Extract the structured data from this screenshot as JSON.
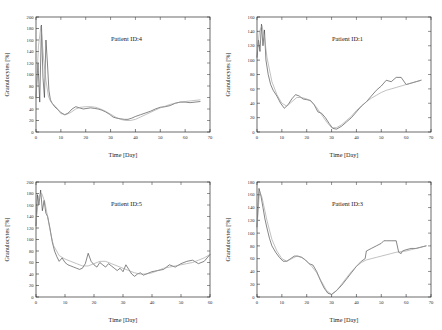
{
  "figure": {
    "layout": "2x2 grid of line plots",
    "panel_order": [
      "p4",
      "p1",
      "p5",
      "p3"
    ]
  },
  "chart_data": [
    {
      "id": "p4",
      "type": "line",
      "title": "Patient ID:4",
      "xlabel": "Time [Day]",
      "ylabel": "Granulocytes [%]",
      "xlim": [
        0,
        70
      ],
      "ylim": [
        0,
        200
      ],
      "xticks": [
        0,
        10,
        20,
        30,
        40,
        50,
        60,
        70
      ],
      "yticks": [
        0,
        20,
        40,
        60,
        80,
        100,
        120,
        140,
        160,
        180,
        200
      ],
      "grid": false,
      "legend": "none",
      "series": [
        {
          "name": "measured",
          "style": "solid-dark",
          "x": [
            0,
            0.8,
            1.5,
            2.2,
            2.8,
            3.4,
            4.0,
            4.6,
            5.2,
            5.8,
            6.5,
            7.5,
            8.5,
            10,
            11.5,
            13,
            14.5,
            16,
            17.5,
            19,
            20.5,
            22,
            23.5,
            25,
            26.5,
            28,
            29.5,
            31,
            32.5,
            34,
            35.5,
            37,
            38.5,
            40,
            42,
            44,
            46,
            48,
            50,
            52,
            54,
            56,
            58,
            60,
            62,
            64,
            66
          ],
          "y": [
            60,
            120,
            52,
            186,
            95,
            60,
            160,
            120,
            72,
            56,
            50,
            44,
            40,
            34,
            30,
            33,
            40,
            44,
            42,
            40,
            41,
            42,
            41,
            40,
            38,
            35,
            31,
            26,
            24,
            23,
            22,
            22,
            24,
            27,
            30,
            33,
            36,
            40,
            43,
            44,
            46,
            50,
            52,
            52,
            51,
            52,
            53
          ]
        },
        {
          "name": "model-fit",
          "style": "solid-light",
          "x": [
            0,
            1,
            2,
            3,
            4,
            5,
            6,
            8,
            10,
            12,
            14,
            16,
            18,
            20,
            22,
            24,
            26,
            28,
            30,
            32,
            34,
            36,
            38,
            40,
            42,
            44,
            46,
            48,
            50,
            52,
            54,
            56,
            58,
            60,
            62,
            64,
            66
          ],
          "y": [
            58,
            150,
            185,
            130,
            90,
            62,
            52,
            44,
            32,
            30,
            34,
            40,
            43,
            44,
            44,
            43,
            40,
            36,
            31,
            26,
            22,
            20,
            20,
            22,
            26,
            30,
            34,
            38,
            42,
            45,
            48,
            50,
            52,
            53,
            54,
            55,
            56
          ]
        }
      ]
    },
    {
      "id": "p1",
      "type": "line",
      "title": "Patient ID:1",
      "xlabel": "Time [Day]",
      "ylabel": "Granulocytes [%]",
      "xlim": [
        0,
        70
      ],
      "ylim": [
        0,
        160
      ],
      "xticks": [
        0,
        10,
        20,
        30,
        40,
        50,
        60,
        70
      ],
      "yticks": [
        0,
        20,
        40,
        60,
        80,
        100,
        120,
        140,
        160
      ],
      "grid": false,
      "legend": "none",
      "series": [
        {
          "name": "measured",
          "style": "solid-dark",
          "x": [
            0,
            0.6,
            1.2,
            1.8,
            2.4,
            3.0,
            3.6,
            4.5,
            5.5,
            6.5,
            8,
            9.5,
            11,
            12.5,
            14,
            15.5,
            17,
            18.5,
            20,
            21.5,
            23,
            24.5,
            26,
            27.5,
            29,
            30.5,
            32,
            34,
            36,
            38,
            40,
            42,
            44,
            46,
            48,
            50,
            52,
            54,
            56,
            58,
            60,
            62,
            64,
            66
          ],
          "y": [
            104,
            128,
            112,
            150,
            120,
            142,
            100,
            80,
            66,
            58,
            50,
            40,
            33,
            38,
            46,
            52,
            50,
            46,
            45,
            44,
            38,
            28,
            26,
            20,
            12,
            5,
            4,
            8,
            14,
            20,
            28,
            36,
            42,
            50,
            58,
            64,
            72,
            70,
            76,
            76,
            66,
            68,
            70,
            72
          ]
        },
        {
          "name": "model-fit",
          "style": "solid-light",
          "x": [
            0,
            1,
            2,
            3,
            4,
            6,
            8,
            10,
            12,
            14,
            16,
            18,
            20,
            22,
            24,
            26,
            28,
            30,
            32,
            34,
            36,
            38,
            40,
            42,
            44,
            46,
            48,
            50,
            52,
            54,
            56,
            58,
            60,
            62,
            64,
            66
          ],
          "y": [
            110,
            140,
            148,
            132,
            104,
            70,
            52,
            40,
            36,
            42,
            48,
            48,
            46,
            42,
            34,
            24,
            14,
            6,
            6,
            10,
            16,
            22,
            30,
            36,
            42,
            47,
            51,
            55,
            58,
            60,
            62,
            64,
            66,
            68,
            70,
            72
          ]
        }
      ]
    },
    {
      "id": "p5",
      "type": "line",
      "title": "Patient ID:5",
      "xlabel": "Time [Day]",
      "ylabel": "Granulocytes [%]",
      "xlim": [
        0,
        60
      ],
      "ylim": [
        0,
        200
      ],
      "xticks": [
        0,
        10,
        20,
        30,
        40,
        50,
        60
      ],
      "yticks": [
        0,
        20,
        40,
        60,
        80,
        100,
        120,
        140,
        160,
        180,
        200
      ],
      "grid": false,
      "legend": "none",
      "series": [
        {
          "name": "measured",
          "style": "solid-dark",
          "x": [
            0,
            0.5,
            1.0,
            1.6,
            2.2,
            2.8,
            3.4,
            4.0,
            4.8,
            5.6,
            6.4,
            7.2,
            8.0,
            9,
            10,
            11,
            12,
            13,
            14,
            15,
            16,
            17,
            18,
            19,
            20,
            21,
            22,
            23,
            24,
            25,
            26,
            27,
            28,
            29,
            30,
            31,
            32,
            33,
            34,
            35,
            36,
            37,
            38,
            40,
            42,
            44,
            46,
            48,
            50,
            52,
            54,
            56,
            58,
            60
          ],
          "y": [
            124,
            178,
            160,
            186,
            150,
            168,
            146,
            140,
            120,
            96,
            80,
            70,
            62,
            68,
            60,
            56,
            54,
            52,
            50,
            48,
            50,
            58,
            76,
            62,
            56,
            52,
            60,
            56,
            52,
            58,
            54,
            50,
            46,
            50,
            44,
            56,
            48,
            40,
            36,
            40,
            42,
            38,
            40,
            44,
            46,
            48,
            56,
            52,
            58,
            62,
            64,
            58,
            62,
            74
          ]
        },
        {
          "name": "model-fit",
          "style": "solid-light",
          "x": [
            0,
            1,
            2,
            3,
            4,
            5,
            6,
            8,
            10,
            12,
            14,
            16,
            18,
            20,
            22,
            24,
            26,
            28,
            30,
            32,
            34,
            36,
            38,
            40,
            42,
            44,
            46,
            48,
            50,
            52,
            54,
            56,
            58,
            60
          ],
          "y": [
            130,
            176,
            180,
            166,
            140,
            112,
            90,
            72,
            66,
            62,
            58,
            54,
            54,
            58,
            62,
            62,
            58,
            54,
            50,
            46,
            42,
            40,
            40,
            42,
            46,
            50,
            52,
            54,
            56,
            58,
            60,
            64,
            68,
            74
          ]
        }
      ]
    },
    {
      "id": "p3",
      "type": "line",
      "title": "Patient ID:3",
      "xlabel": "Time [Day]",
      "ylabel": "Granulocytes [%]",
      "xlim": [
        0,
        70
      ],
      "ylim": [
        0,
        180
      ],
      "xticks": [
        0,
        10,
        20,
        30,
        40,
        50,
        60,
        70
      ],
      "yticks": [
        0,
        20,
        40,
        60,
        80,
        100,
        120,
        140,
        160,
        180
      ],
      "grid": false,
      "legend": "none",
      "series": [
        {
          "name": "measured",
          "style": "solid-dark",
          "x": [
            0,
            0.8,
            1.6,
            2.4,
            3.2,
            4.0,
            5.0,
            6.0,
            7.5,
            9,
            10.5,
            12,
            13.5,
            15,
            16.5,
            18,
            19.5,
            21,
            22.5,
            24,
            25.5,
            27,
            28.5,
            30,
            32,
            34,
            36,
            38,
            40,
            42,
            43.5,
            44,
            45,
            46,
            48,
            50,
            51,
            52,
            54,
            56,
            57,
            58,
            58.5,
            60,
            62,
            64,
            66,
            68
          ],
          "y": [
            110,
            170,
            158,
            140,
            122,
            108,
            92,
            80,
            70,
            62,
            56,
            56,
            60,
            64,
            64,
            62,
            58,
            52,
            50,
            40,
            26,
            14,
            6,
            4,
            10,
            18,
            28,
            38,
            48,
            56,
            60,
            72,
            74,
            76,
            80,
            84,
            88,
            88,
            88,
            88,
            70,
            68,
            72,
            74,
            76,
            76,
            78,
            80
          ]
        },
        {
          "name": "model-fit",
          "style": "solid-light",
          "x": [
            0,
            1,
            2,
            3,
            4,
            6,
            8,
            10,
            12,
            14,
            16,
            18,
            20,
            22,
            24,
            26,
            28,
            30,
            32,
            34,
            36,
            38,
            40,
            42,
            44,
            46,
            48,
            50,
            52,
            54,
            56,
            58,
            60,
            62,
            64,
            66,
            68
          ],
          "y": [
            108,
            166,
            156,
            138,
            120,
            90,
            72,
            60,
            56,
            60,
            64,
            62,
            56,
            48,
            38,
            24,
            10,
            4,
            10,
            20,
            30,
            40,
            48,
            54,
            58,
            60,
            62,
            64,
            66,
            68,
            70,
            71,
            72,
            74,
            76,
            78,
            80
          ]
        }
      ]
    }
  ]
}
